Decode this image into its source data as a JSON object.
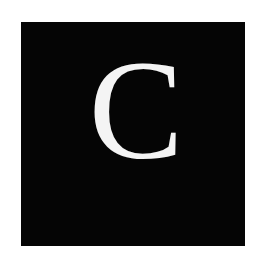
{
  "tile": {
    "letter": "C",
    "background_color": "#050505",
    "letter_color": "#f4f4f4"
  },
  "page": {
    "background_color": "#ffffff"
  }
}
